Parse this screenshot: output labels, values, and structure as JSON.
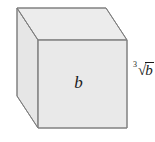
{
  "figure": {
    "kind": "cube-diagram",
    "width": 155,
    "height": 142,
    "background_color": "#ffffff"
  },
  "cube": {
    "face_fill_front": "#e9e9e9",
    "face_fill_top": "#ececec",
    "face_fill_left": "#e6e6e6",
    "edge_color": "#8a8a8a",
    "edge_color_dark": "#6f6f6f",
    "edge_width": 1,
    "front_face": {
      "name": "front-face",
      "points": "38,40 127,40 127,128 38,128"
    },
    "top_face": {
      "name": "top-face",
      "points": "38,40 17,8 106,8 127,40"
    },
    "left_face": {
      "name": "left-face",
      "points": "17,8 38,40 38,128 17,96"
    },
    "hidden_edge": {
      "name": "hidden-back-vertical-edge",
      "visible": false
    }
  },
  "labels": {
    "front_face_label": "b",
    "edge_label": {
      "root_index": "3",
      "radical_sign": "√",
      "radicand": "b",
      "full_text": "∛ b"
    }
  }
}
